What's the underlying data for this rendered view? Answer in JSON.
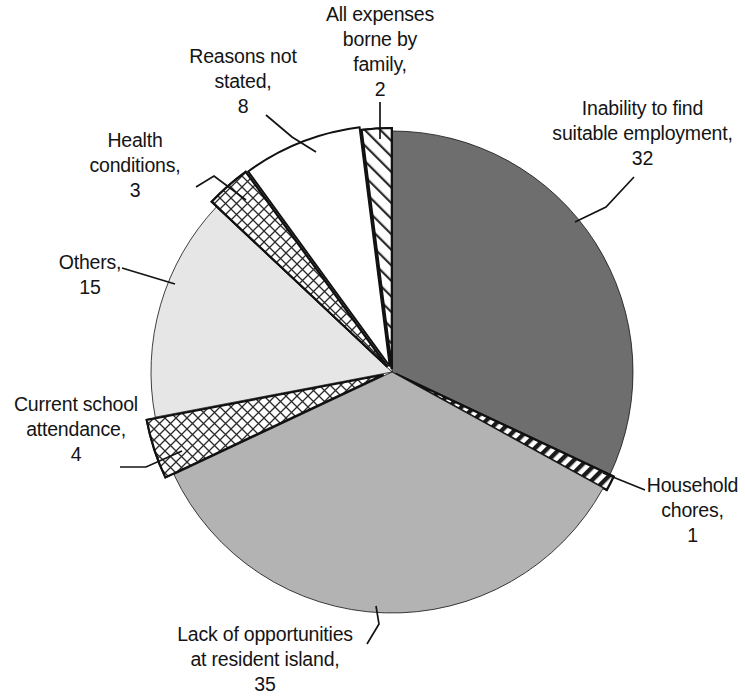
{
  "chart_data": {
    "type": "pie",
    "title": "",
    "subtitle": "",
    "xlabel": "",
    "ylabel": "",
    "legend_position": "none",
    "grid": false,
    "value_total": 100,
    "start_angle_deg": 0,
    "direction": "clockwise",
    "categories": [
      "Inability to find suitable employment",
      "Household chores",
      "Lack of opportunities at resident island",
      "Current school attendance",
      "Others",
      "Health conditions",
      "Reasons not stated",
      "All expenses borne by family"
    ],
    "values": [
      32,
      1,
      35,
      4,
      15,
      3,
      8,
      2
    ],
    "slices": [
      {
        "key": "inability",
        "label": "Inability to find\nsuitable employment,\n32",
        "name": "Inability to find suitable employment",
        "value": 32,
        "fill": "#6e6e6e",
        "pattern": "solid",
        "start_deg": 0,
        "end_deg": 115.2
      },
      {
        "key": "household",
        "label": "Household\nchores,\n1",
        "name": "Household chores",
        "value": 1,
        "fill": "#ffffff",
        "pattern": "diagonal-stripe-dark",
        "start_deg": 115.2,
        "end_deg": 118.8
      },
      {
        "key": "lack",
        "label": "Lack of opportunities\nat resident island,\n35",
        "name": "Lack of opportunities at resident island",
        "value": 35,
        "fill": "#b3b3b3",
        "pattern": "solid",
        "start_deg": 118.8,
        "end_deg": 244.8
      },
      {
        "key": "school",
        "label": "Current school\nattendance,\n4",
        "name": "Current school attendance",
        "value": 4,
        "fill": "#ffffff",
        "pattern": "crosshatch",
        "start_deg": 244.8,
        "end_deg": 259.2
      },
      {
        "key": "others",
        "label": "Others,\n15",
        "name": "Others",
        "value": 15,
        "fill": "#e6e6e6",
        "pattern": "solid",
        "start_deg": 259.2,
        "end_deg": 313.2
      },
      {
        "key": "health",
        "label": "Health\nconditions,\n3",
        "name": "Health conditions",
        "value": 3,
        "fill": "#ffffff",
        "pattern": "crosshatch",
        "start_deg": 313.2,
        "end_deg": 324.0
      },
      {
        "key": "reasons",
        "label": "Reasons not\nstated,\n8",
        "name": "Reasons not stated",
        "value": 8,
        "fill": "#ffffff",
        "pattern": "solid",
        "start_deg": 324.0,
        "end_deg": 352.8
      },
      {
        "key": "allexp",
        "label": "All expenses\nborne by\nfamily,\n2",
        "name": "All expenses borne by family",
        "value": 2,
        "fill": "#ffffff",
        "pattern": "diagonal-stripe-light",
        "start_deg": 352.8,
        "end_deg": 360.0
      }
    ],
    "colors": {
      "dark_gray": "#6e6e6e",
      "medium_gray": "#b3b3b3",
      "light_gray": "#e6e6e6",
      "outline": "#111111",
      "background": "#ffffff",
      "text": "#141414"
    }
  }
}
